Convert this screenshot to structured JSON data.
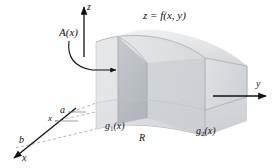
{
  "figure": {
    "title_hidden": "Solid region bounded above by z = f(x, y) over plane region R",
    "background_color": "#ffffff",
    "ink_color": "#111111"
  },
  "axes": {
    "z_label": "z",
    "y_label": "y",
    "x_label": "x"
  },
  "labels": {
    "cross_section_area": "A(x)",
    "surface_equation": "z = f(x, y)",
    "lower_bound_curve": "g",
    "lower_bound_curve_sub": "1",
    "lower_bound_curve_arg": "(x)",
    "upper_bound_curve": "g",
    "upper_bound_curve_sub": "2",
    "upper_bound_curve_arg": "(x)",
    "region": "R",
    "limit_a": "a",
    "limit_b": "b",
    "slice_position": "x"
  },
  "colors": {
    "surface_light": "#e9eaec",
    "surface_mid": "#dcdee1",
    "surface_dark": "#c9ccd0",
    "slab_face": "#b9bdc2",
    "base_shade": "#d2d5d9",
    "grid_line": "#b6babf",
    "axis_line": "#1b1b1b",
    "dashed_line": "#9aa0a6"
  }
}
